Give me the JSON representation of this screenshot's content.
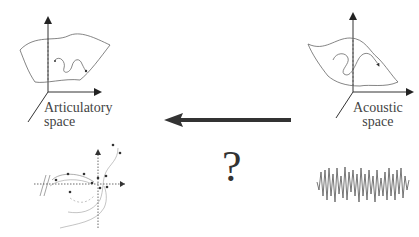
{
  "left_panel": {
    "label_line1": "Articulatory",
    "label_line2": "space"
  },
  "right_panel": {
    "label_line1": "Acoustic",
    "label_line2": "space"
  },
  "center": {
    "question_mark": "?",
    "arrow_direction": "left"
  },
  "colors": {
    "line": "#444444",
    "arrow": "#333333",
    "background": "#ffffff"
  }
}
